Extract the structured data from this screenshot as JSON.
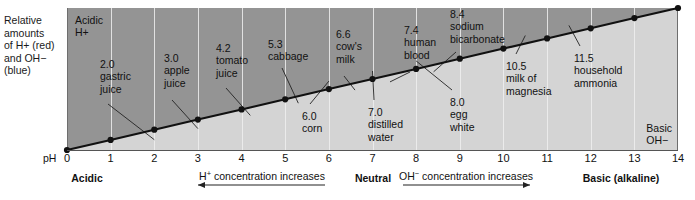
{
  "figure": {
    "side_caption": "Relative\namounts\nof H+ (red)\nand OH−\n(blue)",
    "ph_axis_tag": "pH",
    "corner_acidic": "Acidic\nH+",
    "corner_basic": "Basic\nOH−",
    "footer": {
      "acidic": "Acidic",
      "neutral": "Neutral",
      "basic": "Basic (alkaline)",
      "h_arrow_text": "H+ concentration increases",
      "oh_arrow_text": "OH− concentration increases"
    }
  },
  "chart_data": {
    "type": "line",
    "title": "",
    "xlabel": "pH",
    "ylabel": "Relative amounts of H+ (red) and OH− (blue)",
    "xlim": [
      0,
      14
    ],
    "ylim": [
      0,
      1
    ],
    "grid": true,
    "legend_position": "none",
    "x": [
      0,
      1,
      2,
      3,
      4,
      5,
      6,
      7,
      8,
      9,
      10,
      11,
      12,
      13,
      14
    ],
    "tick_labels": [
      "0",
      "1",
      "2",
      "3",
      "4",
      "5",
      "6",
      "7",
      "8",
      "9",
      "10",
      "11",
      "12",
      "13",
      "14"
    ],
    "series": [
      {
        "name": "OH− relative amount",
        "values": [
          0,
          0.0714,
          0.1429,
          0.2143,
          0.2857,
          0.3571,
          0.4286,
          0.5,
          0.5714,
          0.6429,
          0.7143,
          0.7857,
          0.8571,
          0.9286,
          1.0
        ]
      }
    ],
    "annotations": [
      {
        "ph": "2.0",
        "name": "gastric\njuice",
        "x": 2.0,
        "side": "above"
      },
      {
        "ph": "3.0",
        "name": "apple\njuice",
        "x": 3.0,
        "side": "above"
      },
      {
        "ph": "4.2",
        "name": "tomato\njuice",
        "x": 4.2,
        "side": "above"
      },
      {
        "ph": "5.3",
        "name": "cabbage",
        "x": 5.3,
        "side": "above"
      },
      {
        "ph": "6.0",
        "name": "corn",
        "x": 6.0,
        "side": "below"
      },
      {
        "ph": "6.6",
        "name": "cow's\nmilk",
        "x": 6.6,
        "side": "above"
      },
      {
        "ph": "7.0",
        "name": "distilled\nwater",
        "x": 7.0,
        "side": "below"
      },
      {
        "ph": "7.4",
        "name": "human\nblood",
        "x": 7.4,
        "side": "above"
      },
      {
        "ph": "8.0",
        "name": "egg\nwhite",
        "x": 8.0,
        "side": "below"
      },
      {
        "ph": "8.4",
        "name": "sodium\nbicarbonate",
        "x": 8.4,
        "side": "above"
      },
      {
        "ph": "10.5",
        "name": "milk of\nmagnesia",
        "x": 10.5,
        "side": "below"
      },
      {
        "ph": "11.5",
        "name": "household\nammonia",
        "x": 11.5,
        "side": "below"
      }
    ]
  },
  "labels": {
    "l0": "2.0\ngastric\njuice",
    "l1": "3.0\napple\njuice",
    "l2": "4.2\ntomato\njuice",
    "l3": "5.3\ncabbage",
    "l4": "6.0\ncorn",
    "l5": "6.6\ncow's\nmilk",
    "l6": "7.0\ndistilled\nwater",
    "l7": "7.4\nhuman\nblood",
    "l8": "8.0\negg\nwhite",
    "l9": "8.4\nsodium\nbicarbonate",
    "l10": "10.5\nmilk of\nmagnesia",
    "l11": "11.5\nhousehold\nammonia"
  },
  "colors": {
    "upper_fill": "#949494",
    "lower_fill": "#d4d4d4",
    "line": "#111111",
    "grid": "#efefef",
    "text": "#111111"
  }
}
